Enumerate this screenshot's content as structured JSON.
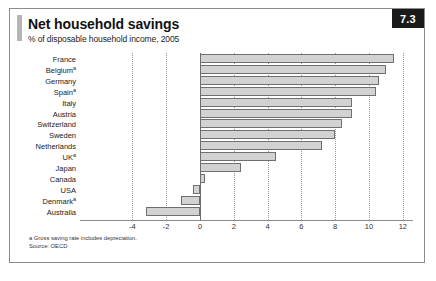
{
  "figure": {
    "number_badge": "7.3",
    "title": "Net household savings",
    "subtitle": "% of disposable household income, 2005",
    "footnote": "a Gross saving rate includes depreciation.",
    "source": "Source: OECD"
  },
  "colors": {
    "bar_fill": "#d2d2d2",
    "bar_stroke": "#6f6f6f",
    "badge_bg": "#1a1a1a",
    "badge_text": "#ffffff",
    "accent": "#b5b5b5",
    "frame": "#8c8c8c",
    "gridline": "#9a9a9a"
  },
  "chart_data": {
    "type": "bar",
    "orientation": "horizontal",
    "title": "Net household savings",
    "subtitle": "% of disposable household income, 2005",
    "xlabel": "",
    "ylabel": "",
    "xlim": [
      -4,
      12
    ],
    "xticks": [
      -4,
      -2,
      0,
      2,
      4,
      6,
      8,
      10,
      12
    ],
    "xtick_labels": [
      "-4",
      "-2",
      "0",
      "2",
      "4",
      "6",
      "8",
      "10",
      "12"
    ],
    "grid": true,
    "legend": false,
    "categories": [
      "France",
      "Belgium",
      "Germany",
      "Spain",
      "Italy",
      "Austria",
      "Switzerland",
      "Sweden",
      "Netherlands",
      "UK",
      "Japan",
      "Canada",
      "USA",
      "Denmark",
      "Australia"
    ],
    "category_footnote_marks": [
      "",
      "a",
      "",
      "a",
      "",
      "",
      "",
      "",
      "",
      "a",
      "",
      "",
      "",
      "a",
      ""
    ],
    "values": [
      11.5,
      11.0,
      10.6,
      10.4,
      9.0,
      9.0,
      8.4,
      8.0,
      7.2,
      4.5,
      2.4,
      0.3,
      -0.4,
      -1.1,
      -3.2
    ],
    "units": "% of disposable household income",
    "source": "OECD"
  }
}
